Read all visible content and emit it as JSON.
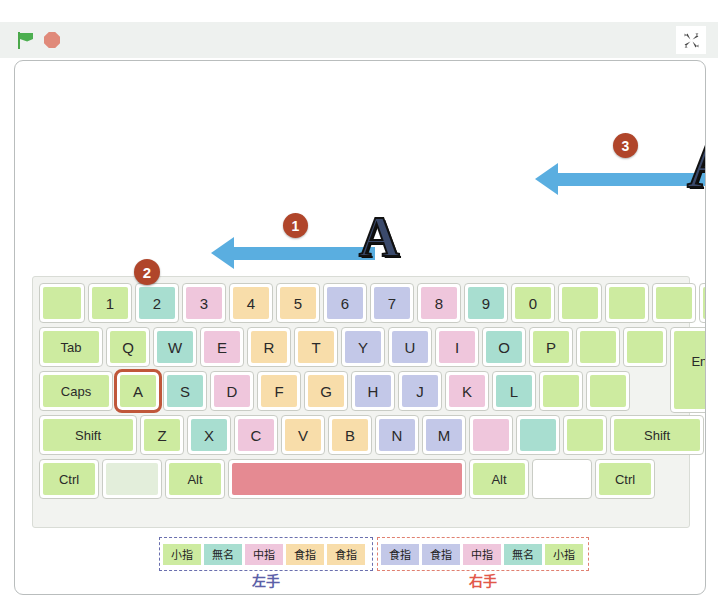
{
  "toolbar": {
    "green_flag_icon": "green-flag-icon",
    "stop_icon": "stop-sign-icon",
    "fullscreen_icon": "exit-fullscreen-icon"
  },
  "colors": {
    "key_green": "#cdeba0",
    "key_teal": "#a8ded0",
    "key_pink": "#efc6dc",
    "key_orange": "#f8ddaa",
    "key_blue": "#c3c8e8",
    "key_blank_pale": "#e3eedb",
    "spacebar_red": "#e58a92",
    "arrow_blue": "#5aaee0",
    "badge_rust": "#b0452a",
    "highlight_border": "#c0573a",
    "sprite_navy": "#3b4a6b",
    "left_hand_outline": "#6a6fae",
    "right_hand_outline": "#e08070"
  },
  "stage": {
    "sprites": [
      {
        "name": "letter-a-sprite-1",
        "label": "A",
        "badge": "1",
        "direction": "left"
      },
      {
        "name": "letter-a-sprite-2",
        "label": "A",
        "badge": "3",
        "direction": "left"
      }
    ]
  },
  "keyboard": {
    "highlighted_key": "A",
    "highlight_badge": "2",
    "rows": [
      {
        "name": "number-row",
        "keys": [
          {
            "label": "",
            "w": 46,
            "color": "#cdeba0"
          },
          {
            "label": "1",
            "w": 44,
            "color": "#cdeba0"
          },
          {
            "label": "2",
            "w": 44,
            "color": "#a8ded0"
          },
          {
            "label": "3",
            "w": 44,
            "color": "#efc6dc"
          },
          {
            "label": "4",
            "w": 44,
            "color": "#f8ddaa"
          },
          {
            "label": "5",
            "w": 44,
            "color": "#f8ddaa"
          },
          {
            "label": "6",
            "w": 44,
            "color": "#c3c8e8"
          },
          {
            "label": "7",
            "w": 44,
            "color": "#c3c8e8"
          },
          {
            "label": "8",
            "w": 44,
            "color": "#efc6dc"
          },
          {
            "label": "9",
            "w": 44,
            "color": "#a8ded0"
          },
          {
            "label": "0",
            "w": 44,
            "color": "#cdeba0"
          },
          {
            "label": "",
            "w": 44,
            "color": "#cdeba0"
          },
          {
            "label": "",
            "w": 44,
            "color": "#cdeba0"
          },
          {
            "label": "",
            "w": 44,
            "color": "#cdeba0"
          },
          {
            "label": "",
            "w": 48,
            "color": "#cdeba0"
          }
        ]
      },
      {
        "name": "qwerty-row",
        "keys": [
          {
            "label": "Tab",
            "w": 64,
            "color": "#cdeba0"
          },
          {
            "label": "Q",
            "w": 44,
            "color": "#cdeba0"
          },
          {
            "label": "W",
            "w": 44,
            "color": "#a8ded0"
          },
          {
            "label": "E",
            "w": 44,
            "color": "#efc6dc"
          },
          {
            "label": "R",
            "w": 44,
            "color": "#f8ddaa"
          },
          {
            "label": "T",
            "w": 44,
            "color": "#f8ddaa"
          },
          {
            "label": "Y",
            "w": 44,
            "color": "#c3c8e8"
          },
          {
            "label": "U",
            "w": 44,
            "color": "#c3c8e8"
          },
          {
            "label": "I",
            "w": 44,
            "color": "#efc6dc"
          },
          {
            "label": "O",
            "w": 44,
            "color": "#a8ded0"
          },
          {
            "label": "P",
            "w": 44,
            "color": "#cdeba0"
          },
          {
            "label": "",
            "w": 44,
            "color": "#cdeba0"
          },
          {
            "label": "",
            "w": 44,
            "color": "#cdeba0"
          },
          {
            "label": "Enter",
            "w": 74,
            "color": "#cdeba0",
            "tall": true
          }
        ]
      },
      {
        "name": "home-row",
        "keys": [
          {
            "label": "Caps",
            "w": 74,
            "color": "#cdeba0"
          },
          {
            "label": "A",
            "w": 44,
            "color": "#cdeba0",
            "highlight": true
          },
          {
            "label": "S",
            "w": 44,
            "color": "#a8ded0"
          },
          {
            "label": "D",
            "w": 44,
            "color": "#efc6dc"
          },
          {
            "label": "F",
            "w": 44,
            "color": "#f8ddaa"
          },
          {
            "label": "G",
            "w": 44,
            "color": "#f8ddaa"
          },
          {
            "label": "H",
            "w": 44,
            "color": "#c3c8e8"
          },
          {
            "label": "J",
            "w": 44,
            "color": "#c3c8e8"
          },
          {
            "label": "K",
            "w": 44,
            "color": "#efc6dc"
          },
          {
            "label": "L",
            "w": 44,
            "color": "#a8ded0"
          },
          {
            "label": "",
            "w": 44,
            "color": "#cdeba0"
          },
          {
            "label": "",
            "w": 44,
            "color": "#cdeba0"
          }
        ]
      },
      {
        "name": "zxcv-row",
        "keys": [
          {
            "label": "Shift",
            "w": 98,
            "color": "#cdeba0"
          },
          {
            "label": "Z",
            "w": 44,
            "color": "#cdeba0"
          },
          {
            "label": "X",
            "w": 44,
            "color": "#a8ded0"
          },
          {
            "label": "C",
            "w": 44,
            "color": "#efc6dc"
          },
          {
            "label": "V",
            "w": 44,
            "color": "#f8ddaa"
          },
          {
            "label": "B",
            "w": 44,
            "color": "#f8ddaa"
          },
          {
            "label": "N",
            "w": 44,
            "color": "#c3c8e8"
          },
          {
            "label": "M",
            "w": 44,
            "color": "#c3c8e8"
          },
          {
            "label": "",
            "w": 44,
            "color": "#efc6dc"
          },
          {
            "label": "",
            "w": 44,
            "color": "#a8ded0"
          },
          {
            "label": "",
            "w": 44,
            "color": "#cdeba0"
          },
          {
            "label": "Shift",
            "w": 94,
            "color": "#cdeba0"
          }
        ]
      },
      {
        "name": "bottom-row",
        "keys": [
          {
            "label": "Ctrl",
            "w": 60,
            "color": "#cdeba0"
          },
          {
            "label": "",
            "w": 60,
            "color": "#e3eedb"
          },
          {
            "label": "Alt",
            "w": 60,
            "color": "#cdeba0"
          },
          {
            "label": "",
            "w": 238,
            "color": "#e58a92"
          },
          {
            "label": "Alt",
            "w": 60,
            "color": "#cdeba0"
          },
          {
            "label": "",
            "w": 60,
            "color": "#ffffff"
          },
          {
            "label": "Ctrl",
            "w": 60,
            "color": "#cdeba0"
          }
        ]
      }
    ]
  },
  "finger_legend": {
    "left_hand": {
      "name": "左手",
      "fingers": [
        {
          "label": "小指",
          "color": "#cdeba0"
        },
        {
          "label": "無名",
          "color": "#a8ded0"
        },
        {
          "label": "中指",
          "color": "#efc6dc"
        },
        {
          "label": "食指",
          "color": "#f8ddaa"
        },
        {
          "label": "食指",
          "color": "#f8ddaa"
        }
      ]
    },
    "right_hand": {
      "name": "右手",
      "fingers": [
        {
          "label": "食指",
          "color": "#c3c8e8"
        },
        {
          "label": "食指",
          "color": "#c3c8e8"
        },
        {
          "label": "中指",
          "color": "#efc6dc"
        },
        {
          "label": "無名",
          "color": "#a8ded0"
        },
        {
          "label": "小指",
          "color": "#cdeba0"
        }
      ]
    }
  }
}
